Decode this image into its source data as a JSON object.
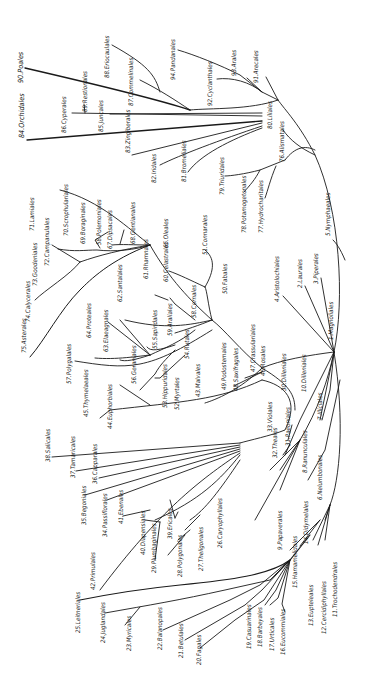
{
  "diagram": {
    "title": "",
    "root": "1.Magnoliales",
    "labels": [
      {
        "id": "1",
        "text": "1.Magnoliales",
        "x": 333,
        "y": 340,
        "big": false
      },
      {
        "id": "2",
        "text": "2.Laurales",
        "x": 302,
        "y": 288
      },
      {
        "id": "3",
        "text": "3.Piperales",
        "x": 318,
        "y": 284
      },
      {
        "id": "4",
        "text": "4.Aristolochiales",
        "x": 279,
        "y": 302
      },
      {
        "id": "5",
        "text": "5.Nymphaeales",
        "x": 330,
        "y": 236
      },
      {
        "id": "6",
        "text": "6.Nelumbonales",
        "x": 322,
        "y": 500
      },
      {
        "id": "7",
        "text": "7.Illiciales",
        "x": 322,
        "y": 420
      },
      {
        "id": "8",
        "text": "8.Ranunculales",
        "x": 307,
        "y": 473
      },
      {
        "id": "9",
        "text": "9.Papaverales",
        "x": 282,
        "y": 550
      },
      {
        "id": "10",
        "text": "10.Dilleniales",
        "x": 306,
        "y": 392
      },
      {
        "id": "11",
        "text": "11.Trochodendrales",
        "x": 337,
        "y": 617
      },
      {
        "id": "12",
        "text": "12.Cercidiphyllales",
        "x": 326,
        "y": 634
      },
      {
        "id": "13",
        "text": "13.Eupteleales",
        "x": 313,
        "y": 626
      },
      {
        "id": "14",
        "text": "14.Didymelales",
        "x": 308,
        "y": 544
      },
      {
        "id": "15",
        "text": "15.Hamamelidales",
        "x": 297,
        "y": 588
      },
      {
        "id": "16",
        "text": "16.Eucommiales",
        "x": 285,
        "y": 655
      },
      {
        "id": "17",
        "text": "17.Urticales",
        "x": 274,
        "y": 651
      },
      {
        "id": "18",
        "text": "18.Barbeyales",
        "x": 262,
        "y": 647
      },
      {
        "id": "19",
        "text": "19.Casuarinales",
        "x": 251,
        "y": 649
      },
      {
        "id": "20",
        "text": "20.Fagales",
        "x": 201,
        "y": 665
      },
      {
        "id": "21",
        "text": "21.Betulales",
        "x": 183,
        "y": 658
      },
      {
        "id": "22",
        "text": "22.Balanopales",
        "x": 162,
        "y": 650
      },
      {
        "id": "23",
        "text": "23.Myricales",
        "x": 131,
        "y": 651
      },
      {
        "id": "24",
        "text": "24.Juglandales",
        "x": 105,
        "y": 643
      },
      {
        "id": "25",
        "text": "25.Leitneriales",
        "x": 80,
        "y": 633
      },
      {
        "id": "26",
        "text": "26.Caryophyllales",
        "x": 222,
        "y": 548
      },
      {
        "id": "27",
        "text": "27.Theligonales",
        "x": 203,
        "y": 571
      },
      {
        "id": "28",
        "text": "28.Polygonales",
        "x": 182,
        "y": 577
      },
      {
        "id": "29",
        "text": "29.Plumbaginales",
        "x": 156,
        "y": 573
      },
      {
        "id": "30",
        "text": "30.Dilleniales",
        "x": 286,
        "y": 391
      },
      {
        "id": "31",
        "text": "31.Paeoniales",
        "x": 290,
        "y": 446
      },
      {
        "id": "32",
        "text": "32.Theales",
        "x": 277,
        "y": 458
      },
      {
        "id": "33",
        "text": "33.Violales",
        "x": 272,
        "y": 432
      },
      {
        "id": "34",
        "text": "34.Passiflorales",
        "x": 107,
        "y": 537
      },
      {
        "id": "35",
        "text": "35.Begoniales",
        "x": 86,
        "y": 525
      },
      {
        "id": "36",
        "text": "36.Capparales",
        "x": 97,
        "y": 484
      },
      {
        "id": "37",
        "text": "37.Tamaricales",
        "x": 75,
        "y": 478
      },
      {
        "id": "38",
        "text": "38.Salicales",
        "x": 50,
        "y": 462
      },
      {
        "id": "39",
        "text": "39.Ericales",
        "x": 172,
        "y": 539
      },
      {
        "id": "40",
        "text": "40.Diapensiales",
        "x": 145,
        "y": 555
      },
      {
        "id": "41",
        "text": "41.Ebenales",
        "x": 123,
        "y": 524
      },
      {
        "id": "42",
        "text": "42.Primulales",
        "x": 95,
        "y": 590
      },
      {
        "id": "43",
        "text": "43.Malvales",
        "x": 200,
        "y": 397
      },
      {
        "id": "44",
        "text": "44.Euphorbiales",
        "x": 112,
        "y": 429
      },
      {
        "id": "45",
        "text": "45.Thymelaeales",
        "x": 88,
        "y": 417
      },
      {
        "id": "46",
        "text": "46.Rosales",
        "x": 265,
        "y": 376
      },
      {
        "id": "47",
        "text": "47.Crassulariales",
        "x": 255,
        "y": 372
      },
      {
        "id": "48",
        "text": "48.Saxifragales",
        "x": 238,
        "y": 391
      },
      {
        "id": "49",
        "text": "49.Podostemales",
        "x": 226,
        "y": 390
      },
      {
        "id": "50",
        "text": "50.Fabales",
        "x": 227,
        "y": 294
      },
      {
        "id": "51",
        "text": "51.Connarales",
        "x": 207,
        "y": 255
      },
      {
        "id": "52",
        "text": "52.Myrtales",
        "x": 179,
        "y": 410
      },
      {
        "id": "53",
        "text": "53.Hippuridales",
        "x": 167,
        "y": 408
      },
      {
        "id": "54",
        "text": "54.Rutales",
        "x": 189,
        "y": 359
      },
      {
        "id": "55",
        "text": "55.Sapindales",
        "x": 157,
        "y": 349
      },
      {
        "id": "56",
        "text": "56.Geraniales",
        "x": 136,
        "y": 384
      },
      {
        "id": "57",
        "text": "57.Polygalales",
        "x": 71,
        "y": 384
      },
      {
        "id": "58",
        "text": "58.Cornales",
        "x": 196,
        "y": 318
      },
      {
        "id": "59",
        "text": "59.Araliales",
        "x": 172,
        "y": 336
      },
      {
        "id": "60",
        "text": "60.Celastrales",
        "x": 168,
        "y": 282
      },
      {
        "id": "61",
        "text": "61.Rhamnales",
        "x": 148,
        "y": 279
      },
      {
        "id": "62",
        "text": "62.Santalales",
        "x": 122,
        "y": 302
      },
      {
        "id": "63",
        "text": "63.Elaeagnales",
        "x": 108,
        "y": 352
      },
      {
        "id": "64",
        "text": "64.Proteales",
        "x": 91,
        "y": 338
      },
      {
        "id": "65",
        "text": "65.Oleales",
        "x": 168,
        "y": 248
      },
      {
        "id": "67",
        "text": "67.Dipsacales",
        "x": 112,
        "y": 249
      },
      {
        "id": "68",
        "text": "68.Gentianales",
        "x": 135,
        "y": 244
      },
      {
        "id": "69",
        "text": "69.Boraginales",
        "x": 85,
        "y": 244
      },
      {
        "id": "58b",
        "text": "58.Polemoniales",
        "x": 101,
        "y": 245
      },
      {
        "id": "70",
        "text": "70.Scrophulariales",
        "x": 68,
        "y": 236
      },
      {
        "id": "71",
        "text": "71.Lamiales",
        "x": 34,
        "y": 231
      },
      {
        "id": "72",
        "text": "72.Campanulales",
        "x": 49,
        "y": 266
      },
      {
        "id": "73",
        "text": "73.Goodeniales",
        "x": 37,
        "y": 286
      },
      {
        "id": "74",
        "text": "74.Calycerales",
        "x": 30,
        "y": 322
      },
      {
        "id": "75",
        "text": "75.Asterales",
        "x": 26,
        "y": 353
      },
      {
        "id": "76",
        "text": "76.Alismatales",
        "x": 284,
        "y": 162
      },
      {
        "id": "77",
        "text": "77.Hydrocharitales",
        "x": 263,
        "y": 233
      },
      {
        "id": "78",
        "text": "78.Potamogetonales",
        "x": 246,
        "y": 233
      },
      {
        "id": "79",
        "text": "79.Triuridales",
        "x": 224,
        "y": 195
      },
      {
        "id": "80",
        "text": "80.Liliales",
        "x": 272,
        "y": 129
      },
      {
        "id": "81",
        "text": "81.Bromeliales",
        "x": 186,
        "y": 182
      },
      {
        "id": "82",
        "text": "82.Iridales",
        "x": 156,
        "y": 183
      },
      {
        "id": "83",
        "text": "83.Zingiberales",
        "x": 130,
        "y": 153
      },
      {
        "id": "84",
        "text": "84.Orchidales",
        "x": 24,
        "y": 138,
        "big": true
      },
      {
        "id": "85",
        "text": "85.Juncales",
        "x": 103,
        "y": 132
      },
      {
        "id": "86",
        "text": "86.Cyperales",
        "x": 66,
        "y": 133
      },
      {
        "id": "87",
        "text": "87.Commelinales",
        "x": 133,
        "y": 106
      },
      {
        "id": "88",
        "text": "88.Eriocaulales",
        "x": 109,
        "y": 78
      },
      {
        "id": "89",
        "text": "89.Restionales",
        "x": 87,
        "y": 112
      },
      {
        "id": "90",
        "text": "90.Poales",
        "x": 23,
        "y": 83,
        "big": true
      },
      {
        "id": "91",
        "text": "91.Arecales",
        "x": 258,
        "y": 83
      },
      {
        "id": "92",
        "text": "92.Cyclanthales",
        "x": 212,
        "y": 106
      },
      {
        "id": "93",
        "text": "93.Arales",
        "x": 236,
        "y": 76
      },
      {
        "id": "94",
        "text": "94.Pandanales",
        "x": 175,
        "y": 80
      }
    ]
  }
}
